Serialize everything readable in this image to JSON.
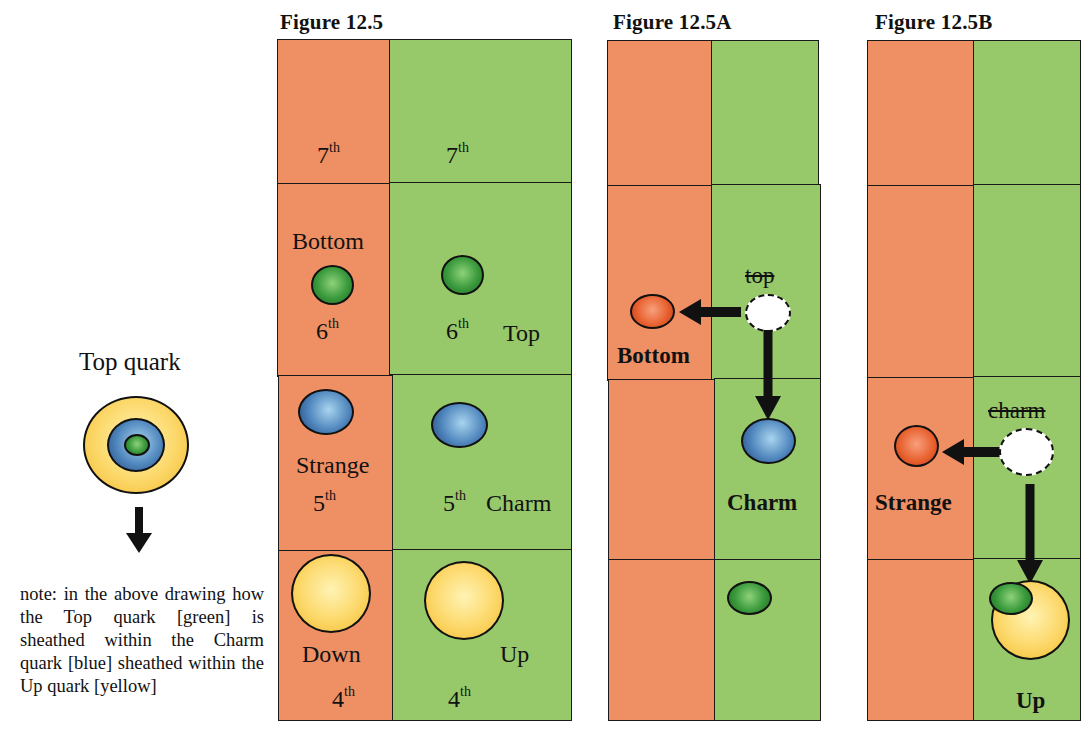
{
  "legend": {
    "title": "Top quark",
    "note": "note: in the above drawing how the Top quark [green] is sheathed within the Charm quark [blue] sheathed within the Up quark [yellow]",
    "layers": [
      "yellow (Up)",
      "blue (Charm)",
      "green (Top)"
    ]
  },
  "colors": {
    "orange_column": "#ee8f64",
    "green_column": "#97c86a",
    "quark_green": "#3a9a3c",
    "quark_blue": "#4f86bd",
    "quark_yellow": "#fcd86a",
    "quark_red": "#e75e2c"
  },
  "figures": [
    {
      "title": "Figure 12.5",
      "labels": {
        "r7_left": "7",
        "r7_right": "7",
        "bottom": "Bottom",
        "r6_left": "6",
        "r6_right": "6",
        "top": "Top",
        "strange": "Strange",
        "r5_left": "5",
        "r5_right": "5",
        "charm": "Charm",
        "down": "Down",
        "up": "Up",
        "r4_left": "4",
        "r4_right": "4",
        "suffix": "th"
      }
    },
    {
      "title": "Figure 12.5A",
      "labels": {
        "struck": "top",
        "left_result": "Bottom",
        "right_result": "Charm"
      }
    },
    {
      "title": "Figure 12.5B",
      "labels": {
        "struck": "charm",
        "left_result": "Strange",
        "right_result": "Up"
      }
    }
  ]
}
